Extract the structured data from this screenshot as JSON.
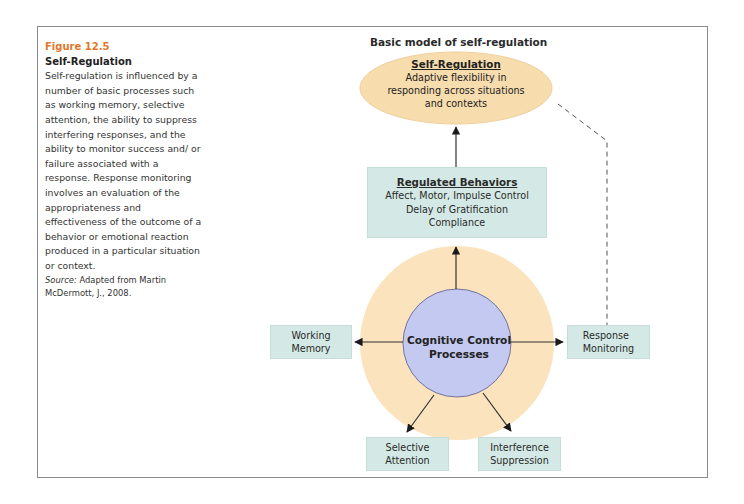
{
  "caption": {
    "figure_number": "Figure 12.5",
    "title": "Self-Regulation",
    "body": "Self-regulation is influenced by a number of basic processes such as working memory, selective attention, the ability to suppress interfering responses, and the ability to monitor success and/ or failure associated with a response. Response monitoring involves an evaluation of the appropriateness and effectiveness of the outcome of a behavior or emotional reaction produced in a particular situation or context.",
    "source_label": "Source:",
    "source_text": "Adapted from Martin McDermott, J., 2008."
  },
  "diagram": {
    "title": "Basic model of self-regulation",
    "self_regulation": {
      "heading": "Self-Regulation",
      "line1": "Adaptive flexibility in",
      "line2": "responding across situations",
      "line3": "and contexts"
    },
    "regulated_behaviors": {
      "heading": "Regulated Behaviors",
      "line1": "Affect, Motor, Impulse Control",
      "line2": "Delay of Gratification",
      "line3": "Compliance"
    },
    "center": {
      "line1": "Cognitive Control",
      "line2": "Processes"
    },
    "boxes": {
      "working_memory": {
        "line1": "Working",
        "line2": "Memory"
      },
      "response_monitoring": {
        "line1": "Response",
        "line2": "Monitoring"
      },
      "selective_attention": {
        "line1": "Selective",
        "line2": "Attention"
      },
      "interference_suppression": {
        "line1": "Interference",
        "line2": "Suppression"
      }
    },
    "colors": {
      "ellipse_fill": "#f7dcae",
      "box_fill": "#d4e9e5",
      "outer_ring": "#fbe3bd",
      "inner_circle": "#c3c9f0",
      "caption_accent": "#e0782a"
    }
  }
}
